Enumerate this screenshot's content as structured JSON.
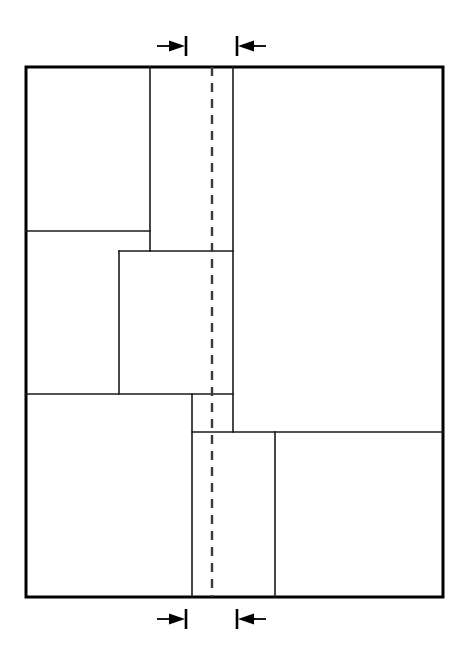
{
  "diagram": {
    "canvas": {
      "width": 462,
      "height": 660,
      "background": "#ffffff"
    },
    "colors": {
      "outline": "#000000",
      "partition": "#1a1a1a",
      "centerline": "#3a3a3a",
      "dimension": "#000000",
      "fill": "#ffffff"
    },
    "outer_boundary": {
      "name": "outer-rectangle",
      "x": 26,
      "y": 67,
      "width": 417,
      "height": 530,
      "stroke_width": 3
    },
    "centerline": {
      "name": "vertical-centerline",
      "x": 212,
      "y_start": 67,
      "y_end": 597,
      "style": "dashed",
      "dash_on": 9,
      "dash_off": 7,
      "stroke_width": 2.4
    },
    "vertical_partitions": [
      {
        "label": "v1",
        "x": 150,
        "y_start": 67,
        "y_end": 251
      },
      {
        "label": "v2",
        "x": 233,
        "y_start": 67,
        "y_end": 432
      },
      {
        "label": "v3",
        "x": 119,
        "y_start": 251,
        "y_end": 394
      },
      {
        "label": "v4",
        "x": 192,
        "y_start": 394,
        "y_end": 597
      },
      {
        "label": "v5",
        "x": 275,
        "y_start": 432,
        "y_end": 597
      }
    ],
    "horizontal_partitions": [
      {
        "label": "h1",
        "y": 231,
        "x_start": 26,
        "x_end": 150
      },
      {
        "label": "h2",
        "y": 251,
        "x_start": 119,
        "x_end": 233
      },
      {
        "label": "h3",
        "y": 394,
        "x_start": 26,
        "x_end": 233
      },
      {
        "label": "h4",
        "y": 432,
        "x_start": 192,
        "x_end": 443
      }
    ],
    "dimension_markers": {
      "top": {
        "y": 46,
        "left": {
          "name": "top-left-dimension-arrow",
          "direction": "right",
          "tick_x": 186,
          "shaft_start_x": 157,
          "shaft_end_x": 186,
          "tick_half_height": 10
        },
        "right": {
          "name": "top-right-dimension-arrow",
          "direction": "left",
          "tick_x": 237,
          "shaft_start_x": 266,
          "shaft_end_x": 237,
          "tick_half_height": 10
        }
      },
      "bottom": {
        "y": 619,
        "left": {
          "name": "bottom-left-dimension-arrow",
          "direction": "right",
          "tick_x": 186,
          "shaft_start_x": 157,
          "shaft_end_x": 186,
          "tick_half_height": 10
        },
        "right": {
          "name": "bottom-right-dimension-arrow",
          "direction": "left",
          "tick_x": 237,
          "shaft_start_x": 266,
          "shaft_end_x": 237,
          "tick_half_height": 10
        }
      }
    },
    "regions": [
      {
        "name": "region-top-left",
        "x": 26,
        "y": 67,
        "width": 124,
        "height": 164
      },
      {
        "name": "region-upper-strip",
        "x": 150,
        "y": 67,
        "width": 83,
        "height": 184
      },
      {
        "name": "region-right-large",
        "x": 233,
        "y": 67,
        "width": 210,
        "height": 365
      },
      {
        "name": "region-mid-left",
        "x": 26,
        "y": 231,
        "width": 93,
        "height": 163
      },
      {
        "name": "region-mid-center",
        "x": 119,
        "y": 251,
        "width": 114,
        "height": 143
      },
      {
        "name": "region-small-step",
        "x": 192,
        "y": 394,
        "width": 41,
        "height": 38
      },
      {
        "name": "region-bottom-left",
        "x": 26,
        "y": 394,
        "width": 166,
        "height": 203
      },
      {
        "name": "region-bottom-center",
        "x": 192,
        "y": 432,
        "width": 83,
        "height": 165
      },
      {
        "name": "region-bottom-right",
        "x": 275,
        "y": 432,
        "width": 168,
        "height": 165
      }
    ]
  }
}
